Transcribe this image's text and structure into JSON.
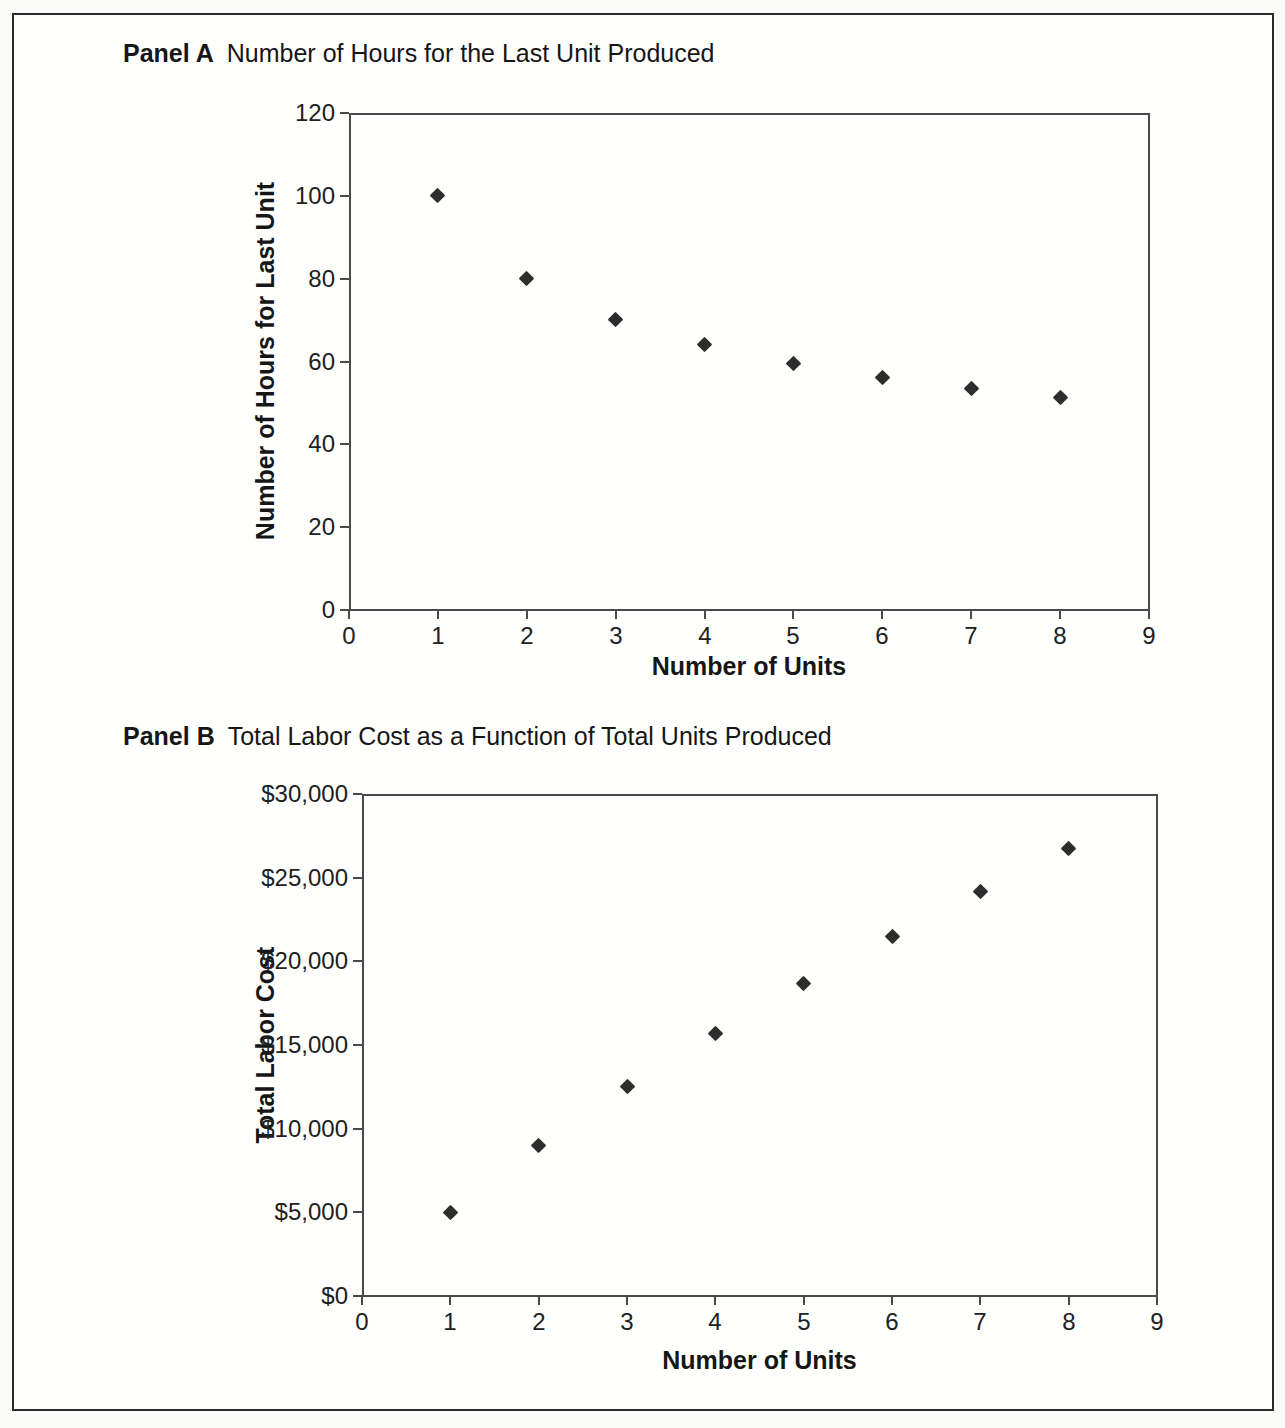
{
  "figure": {
    "background_color": "#fbfbfa",
    "frame_color": "#2c2c2c",
    "axis_color": "#4a4a4a",
    "ink_color": "#1e1e1e",
    "marker_color": "#2d2d2d",
    "marker_shape": "diamond"
  },
  "chart_data": [
    {
      "id": "panel-a",
      "type": "scatter",
      "panel_label": "Panel A",
      "title": "Number of Hours for the Last Unit Produced",
      "xlabel": "Number of Units",
      "ylabel": "Number of Hours for Last Unit",
      "x": [
        1,
        2,
        3,
        4,
        5,
        6,
        7,
        8
      ],
      "y": [
        100,
        80,
        70.2,
        64,
        59.6,
        56.2,
        53.4,
        51.2
      ],
      "xlim": [
        0,
        9
      ],
      "ylim": [
        0,
        120
      ],
      "xtick_values": [
        0,
        1,
        2,
        3,
        4,
        5,
        6,
        7,
        8,
        9
      ],
      "xtick_labels": [
        "0",
        "1",
        "2",
        "3",
        "4",
        "5",
        "6",
        "7",
        "8",
        "9"
      ],
      "ytick_values": [
        0,
        20,
        40,
        60,
        80,
        100,
        120
      ],
      "ytick_labels": [
        "0",
        "20",
        "40",
        "60",
        "80",
        "100",
        "120"
      ],
      "grid": false,
      "legend": "none",
      "marker": "diamond"
    },
    {
      "id": "panel-b",
      "type": "scatter",
      "panel_label": "Panel B",
      "title": "Total Labor Cost as a Function of Total Units Produced",
      "xlabel": "Number of Units",
      "ylabel": "Total Labor Cost",
      "x": [
        1,
        2,
        3,
        4,
        5,
        6,
        7,
        8
      ],
      "y": [
        5000,
        9000,
        12511,
        15711,
        18689,
        21497,
        24170,
        26730
      ],
      "xlim": [
        0,
        9
      ],
      "ylim": [
        0,
        30000
      ],
      "xtick_values": [
        0,
        1,
        2,
        3,
        4,
        5,
        6,
        7,
        8,
        9
      ],
      "xtick_labels": [
        "0",
        "1",
        "2",
        "3",
        "4",
        "5",
        "6",
        "7",
        "8",
        "9"
      ],
      "ytick_values": [
        0,
        5000,
        10000,
        15000,
        20000,
        25000,
        30000
      ],
      "ytick_labels": [
        "$0",
        "$5,000",
        "$10,000",
        "$15,000",
        "$20,000",
        "$25,000",
        "$30,000"
      ],
      "grid": false,
      "legend": "none",
      "marker": "diamond"
    }
  ]
}
